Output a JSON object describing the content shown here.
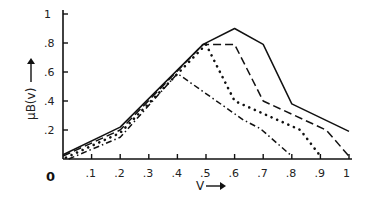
{
  "chart_data": {
    "type": "line",
    "title": "",
    "xlabel": "V",
    "ylabel": "μB(v)",
    "xlim": [
      0,
      1
    ],
    "ylim": [
      0,
      1
    ],
    "grid": false,
    "legend": "none",
    "origin_label": "0",
    "x_ticks": [
      {
        "value": 0.1,
        "label": ".1"
      },
      {
        "value": 0.2,
        "label": ".2"
      },
      {
        "value": 0.3,
        "label": ".3"
      },
      {
        "value": 0.4,
        "label": ".4"
      },
      {
        "value": 0.5,
        "label": ".5"
      },
      {
        "value": 0.6,
        "label": ".6"
      },
      {
        "value": 0.7,
        "label": ".7"
      },
      {
        "value": 0.8,
        "label": ".8"
      },
      {
        "value": 0.9,
        "label": ".9"
      },
      {
        "value": 1.0,
        "label": "1"
      }
    ],
    "y_ticks": [
      {
        "value": 0.2,
        "label": ".2"
      },
      {
        "value": 0.4,
        "label": ".4"
      },
      {
        "value": 0.6,
        "label": ".6"
      },
      {
        "value": 0.8,
        "label": ".8"
      },
      {
        "value": 1.0,
        "label": "1"
      }
    ],
    "series": [
      {
        "name": "solid",
        "style": "solid",
        "x": [
          0.0,
          0.2,
          0.49,
          0.6,
          0.7,
          0.8,
          1.0
        ],
        "y": [
          0.03,
          0.22,
          0.79,
          0.9,
          0.79,
          0.38,
          0.19
        ]
      },
      {
        "name": "dashed",
        "style": "dashed",
        "x": [
          0.0,
          0.2,
          0.49,
          0.6,
          0.7,
          0.92,
          1.0
        ],
        "y": [
          0.02,
          0.2,
          0.79,
          0.79,
          0.4,
          0.2,
          0.02
        ]
      },
      {
        "name": "dotted",
        "style": "dotted",
        "x": [
          0.01,
          0.2,
          0.5,
          0.6,
          0.83,
          0.9
        ],
        "y": [
          0.01,
          0.18,
          0.79,
          0.4,
          0.2,
          0.02
        ]
      },
      {
        "name": "dash-dot",
        "style": "dashdot",
        "x": [
          0.02,
          0.2,
          0.4,
          0.63,
          0.69,
          0.8
        ],
        "y": [
          0.0,
          0.15,
          0.59,
          0.27,
          0.21,
          0.02
        ]
      }
    ]
  }
}
